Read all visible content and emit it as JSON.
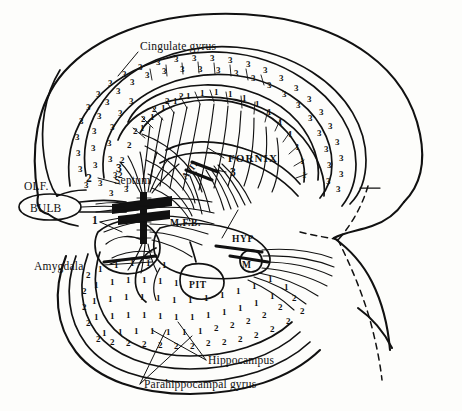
{
  "figure": {
    "background_color": "#fdfdfb",
    "ink_color": "#111111"
  },
  "labels": {
    "cingulate_gyrus": "Cingulate gyrus",
    "fornix": "FORNIX",
    "septum": "Septum",
    "olf": "OLF.",
    "bulb": "BULB",
    "amygdala": "Amygdala",
    "mfb": "M.F.B.",
    "at": "A.T.",
    "hyp": "HYP",
    "m": "M",
    "pit": "PIT",
    "hippocampus": "Hippocampus",
    "parahippocampal_gyrus": "Parahippocampal gyrus"
  },
  "markers": {
    "one": "1",
    "two": "2",
    "three": "3"
  },
  "region_codes": {
    "hippocampus_code": "1",
    "parahippocampal_code": "2",
    "cingulate_code": "3"
  },
  "stipple": {
    "cingulate_digit": "3",
    "hippocampal_band_digit": "1",
    "parahippocampal_band_digit": "2"
  }
}
